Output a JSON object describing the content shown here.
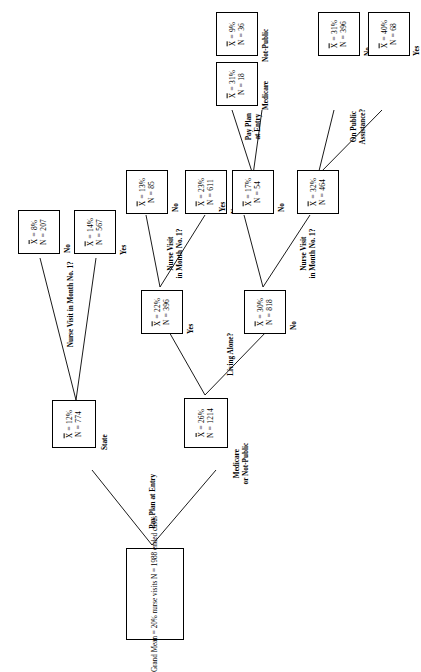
{
  "diagram": {
    "type": "decision-tree",
    "orientation": "rotated-90-counterclockwise",
    "mean_symbol": "X",
    "root": {
      "name": "root-node",
      "line1": "Grand Mean  =  20%",
      "line2": "nurse visits",
      "line3": "N  =  1988",
      "line4": "ended cases"
    },
    "splits": {
      "root_split": "Pay Plan at Entry",
      "state_split": "Nurse Visit in Month No. 1?",
      "living_alone_split": "Living Alone?",
      "alone_yes_split": "Nurse Visit\nin Month No. 1?",
      "alone_no_split": "Nurse Visit\nin Month No. 1?",
      "pay_plan_split2": "Pay Plan\nat Entry",
      "public_assistance_split": "On Public\nAssistance?"
    },
    "nodes": {
      "state": {
        "mean": "= 12%",
        "n": "= 774",
        "label": "State"
      },
      "medicare_or_not_public": {
        "mean": "= 26%",
        "n": "= 1214",
        "label": "Medicare\nor Not-Public"
      },
      "state_no": {
        "mean": "=   8%",
        "n": "=  207",
        "label": "No"
      },
      "state_yes": {
        "mean": "= 14%",
        "n": "= 567",
        "label": "Yes"
      },
      "alone_yes": {
        "mean": "= 22%",
        "n": "= 396",
        "label": "Yes"
      },
      "alone_no": {
        "mean": "= 30%",
        "n": "= 818",
        "label": "No"
      },
      "alone_yes_no": {
        "mean": "= 13%",
        "n": "=  85",
        "label": "No"
      },
      "alone_yes_yes": {
        "mean": "= 23%",
        "n": "= 611",
        "label": "Yes"
      },
      "alone_no_yes": {
        "mean": "= 17%",
        "n": "=  54",
        "label": "Yes"
      },
      "alone_no_no": {
        "mean": "= 32%",
        "n": "= 464",
        "label": "No"
      },
      "not_public": {
        "mean": "=   9%",
        "n": "=  36",
        "label": "Not-Public"
      },
      "medicare": {
        "mean": "= 31%",
        "n": "=  18",
        "label": "Medicare"
      },
      "pa_no": {
        "mean": "= 31%",
        "n": "= 396",
        "label": "No"
      },
      "pa_yes": {
        "mean": "= 40%",
        "n": "=  68",
        "label": "Yes"
      }
    },
    "labels": {
      "mean_eq": "=",
      "n_letter": "N"
    }
  }
}
